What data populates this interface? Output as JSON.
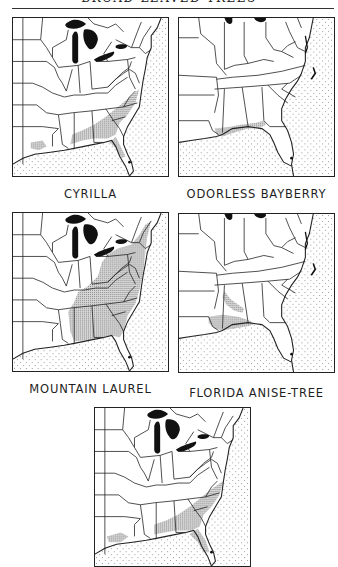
{
  "page": {
    "running_header": "BROAD-LEAVED TREES"
  },
  "maps": [
    {
      "id": "cyrilla",
      "label": "CYRILLA",
      "extent": "eastern-us",
      "range_regions": [
        "coastal-carolinas",
        "georgia-coastal-plain",
        "gulf-coast",
        "louisiana",
        "north-florida",
        "south-florida-spot"
      ]
    },
    {
      "id": "odorless-bayberry",
      "label": "ODORLESS BAYBERRY",
      "extent": "southeast",
      "range_regions": [
        "gulf-coast-alabama-florida-panhandle",
        "mississippi-coast"
      ]
    },
    {
      "id": "mountain-laurel",
      "label": "MOUNTAIN LAUREL",
      "extent": "eastern-us",
      "range_regions": [
        "new-england",
        "appalachians",
        "piedmont",
        "gulf-states"
      ]
    },
    {
      "id": "florida-anise-tree",
      "label": "FLORIDA ANISE-TREE",
      "extent": "southeast",
      "range_regions": [
        "alabama-interior",
        "gulf-coast-mississippi-alabama-panhandle"
      ]
    },
    {
      "id": "unlabeled-bottom-map",
      "label": "",
      "extent": "eastern-us",
      "range_regions": [
        "coastal-carolinas",
        "georgia-coastal-plain",
        "gulf-coast",
        "louisiana",
        "north-florida"
      ]
    }
  ],
  "legend_colors": {
    "lakes": "#111111",
    "range_stipple": "#9a9a9a",
    "ocean_dots": "#8a8a8a",
    "borders": "#222222"
  }
}
